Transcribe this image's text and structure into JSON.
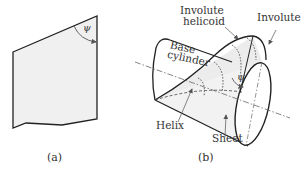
{
  "figure": {
    "panel_a": {
      "caption": "(a)",
      "angle_label": "ψ",
      "description": "Flat sheet (developed) with helix angle ψ"
    },
    "panel_b": {
      "caption": "(b)",
      "angle_label": "ψ",
      "labels": {
        "involute_helicoid_line1": "Involute",
        "involute_helicoid_line2": "helicoid",
        "involute": "Involute",
        "base_cylinder_line1": "Base",
        "base_cylinder_line2": "cylinder",
        "helix": "Helix",
        "sheet": "Sheet"
      }
    },
    "colors": {
      "line": "#222222",
      "sheet_fill": "#efefef",
      "text": "#333333"
    }
  }
}
